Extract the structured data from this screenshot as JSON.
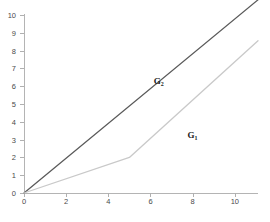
{
  "chart_data": {
    "type": "line",
    "title": "",
    "xlabel": "",
    "ylabel": "",
    "xlim": [
      0,
      11.1
    ],
    "ylim": [
      0,
      10
    ],
    "grid": false,
    "legend": "inline-annotations",
    "x_ticks": [
      0,
      2,
      4,
      6,
      8,
      10
    ],
    "x_tick_labels": [
      "0",
      "2",
      "4",
      "6",
      "8",
      "10"
    ],
    "y_ticks": [
      0,
      1,
      2,
      3,
      4,
      5,
      6,
      7,
      8,
      9,
      10
    ],
    "y_tick_labels": [
      "0",
      "1",
      "2",
      "3",
      "4",
      "5",
      "6",
      "7",
      "8",
      "9",
      "10"
    ],
    "series": [
      {
        "name": "G2",
        "label_text": "G",
        "label_sub": "2",
        "color": "#5a5a5a",
        "width": 1.3,
        "points": [
          [
            0,
            0
          ],
          [
            11.1,
            10.85
          ]
        ],
        "annotation_at": [
          6.15,
          6.25
        ]
      },
      {
        "name": "G1",
        "label_text": "G",
        "label_sub": "1",
        "color": "#c9c9c9",
        "width": 1.3,
        "points": [
          [
            0,
            0
          ],
          [
            5.0,
            2.0
          ],
          [
            11.1,
            8.55
          ]
        ],
        "annotation_at": [
          7.75,
          3.2
        ]
      }
    ]
  },
  "axes": {
    "axis_color": "#b4b4b4",
    "tick_color": "#b0b0b0",
    "tick_label_color": "#4a4a4a"
  }
}
